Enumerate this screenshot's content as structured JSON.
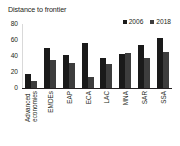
{
  "chart_data": {
    "type": "bar",
    "title": "Distance to frontier",
    "xlabel": "",
    "ylabel": "",
    "ylim": [
      0,
      80
    ],
    "yticks": [
      80,
      60,
      40,
      20,
      0
    ],
    "grid": false,
    "legend_position": "top-right",
    "categories": [
      "Advanced economies",
      "EMDEs",
      "EAP",
      "ECA",
      "LAC",
      "MNA",
      "SAR",
      "SSA"
    ],
    "category_lines": [
      [
        "Advanced",
        "economies"
      ],
      [
        "EMDEs"
      ],
      [
        "EAP"
      ],
      [
        "ECA"
      ],
      [
        "LAC"
      ],
      [
        "MNA"
      ],
      [
        "SAR"
      ],
      [
        "SSA"
      ]
    ],
    "series": [
      {
        "name": "2006",
        "color": "#1a1a1a",
        "values": [
          18,
          50,
          41,
          56,
          37,
          42,
          54,
          62
        ]
      },
      {
        "name": "2018",
        "color": "#3d3d3d",
        "values": [
          9,
          35,
          31,
          14,
          30,
          44,
          38,
          45
        ]
      }
    ]
  }
}
